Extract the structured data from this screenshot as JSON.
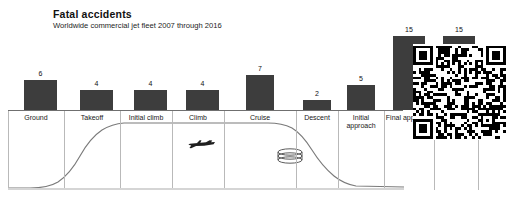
{
  "header": {
    "title": "Fatal accidents",
    "subtitle": "Worldwide commercial jet fleet 2007 through 2016"
  },
  "icons": {
    "airplane": "airplane-silhouette-icon",
    "holding_stack": "holding-pattern-stack-icon",
    "qr": "qr-code-icon"
  },
  "colors": {
    "bar_fill": "#3d3d3d",
    "axis": "#6f6f6f",
    "separator": "#b9b9b9",
    "ground": "#d5d5d5",
    "profile_line": "#7a7a7a",
    "text": "#111111"
  },
  "chart_data": {
    "type": "bar",
    "title": "Fatal accidents",
    "subtitle": "Worldwide commercial jet fleet 2007 through 2016",
    "xlabel": "",
    "ylabel": "",
    "ylim": [
      0,
      15
    ],
    "grid": false,
    "legend": "none",
    "categories": [
      "Ground",
      "Takeoff",
      "Initial climb",
      "Climb",
      "Cruise",
      "Descent",
      "Initial approach",
      "Final approach",
      "Landing"
    ],
    "values": [
      6,
      4,
      4,
      4,
      7,
      2,
      5,
      15,
      15
    ],
    "annotations": [
      "airplane silhouette on cruise segment",
      "holding pattern stack icon over initial approach"
    ]
  },
  "bars": [
    {
      "label": "Ground",
      "value": "6",
      "x": 24,
      "w": 33,
      "cell_x": 8,
      "cell_w": 56,
      "label_x": 8,
      "label_w": 56
    },
    {
      "label": "Takeoff",
      "value": "4",
      "x": 80,
      "w": 33,
      "cell_x": 64,
      "cell_w": 56,
      "label_x": 64,
      "label_w": 56
    },
    {
      "label": "Initial climb",
      "value": "4",
      "x": 134,
      "w": 33,
      "cell_x": 120,
      "cell_w": 52,
      "label_x": 120,
      "label_w": 52
    },
    {
      "label": "Climb",
      "value": "4",
      "x": 186,
      "w": 33,
      "cell_x": 172,
      "cell_w": 52,
      "label_x": 172,
      "label_w": 52
    },
    {
      "label": "Cruise",
      "value": "7",
      "x": 246,
      "w": 28,
      "cell_x": 224,
      "cell_w": 72,
      "label_x": 224,
      "label_w": 72
    },
    {
      "label": "Descent",
      "value": "2",
      "x": 303,
      "w": 28,
      "cell_x": 296,
      "cell_w": 42,
      "label_x": 296,
      "label_w": 42
    },
    {
      "label": "Initial approach",
      "value": "5",
      "x": 347,
      "w": 28,
      "cell_x": 338,
      "cell_w": 46,
      "label_x": 338,
      "label_w": 46
    },
    {
      "label": "Final approach",
      "value": "15",
      "x": 393,
      "w": 32,
      "cell_x": 384,
      "cell_w": 50,
      "label_x": 384,
      "label_w": 50
    },
    {
      "label": "Landing",
      "value": "15",
      "x": 443,
      "w": 32,
      "cell_x": 434,
      "cell_w": 44,
      "label_x": 434,
      "label_w": 44
    }
  ]
}
